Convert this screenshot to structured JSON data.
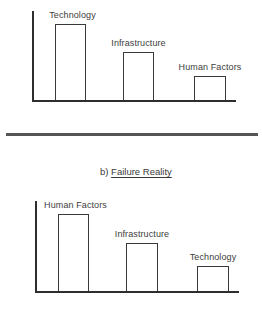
{
  "chart_data": [
    {
      "type": "bar",
      "title": "",
      "categories": [
        "Technology",
        "Infrastructure",
        "Human Factors"
      ],
      "values": [
        76,
        48,
        24
      ],
      "xlabel": "",
      "ylabel": "",
      "ylim": [
        0,
        90
      ],
      "grid": false,
      "legend": "none",
      "notes": "Unlabeled axes; values are relative bar heights (conceptual perception ranking)"
    },
    {
      "type": "bar",
      "title": "b) Failure Reality",
      "categories": [
        "Human Factors",
        "Infrastructure",
        "Technology"
      ],
      "values": [
        77,
        48,
        25
      ],
      "xlabel": "",
      "ylabel": "",
      "ylim": [
        0,
        90
      ],
      "grid": false,
      "legend": "none",
      "notes": "Unlabeled axes; values are relative bar heights"
    }
  ],
  "charts": [
    {
      "layout": {
        "axis_x": 32,
        "axis_top": 11,
        "baseline": 100,
        "axis_end": 236
      },
      "bars": [
        {
          "label": "Technology",
          "x": 55,
          "w": 31,
          "h": 76
        },
        {
          "label": "Infrastructure",
          "x": 123,
          "w": 31,
          "h": 48
        },
        {
          "label": "Human Factors",
          "x": 194,
          "w": 32,
          "h": 24
        }
      ]
    },
    {
      "caption_prefix": "b) ",
      "caption_title": "Failure Reality",
      "layout": {
        "axis_x": 35,
        "axis_top": 201,
        "baseline": 291,
        "axis_end": 239
      },
      "bars": [
        {
          "label": "Human Factors",
          "x": 58,
          "w": 31,
          "h": 77
        },
        {
          "label": "Infrastructure",
          "x": 126,
          "w": 32,
          "h": 48
        },
        {
          "label": "Technology",
          "x": 197,
          "w": 32,
          "h": 25
        }
      ]
    }
  ]
}
